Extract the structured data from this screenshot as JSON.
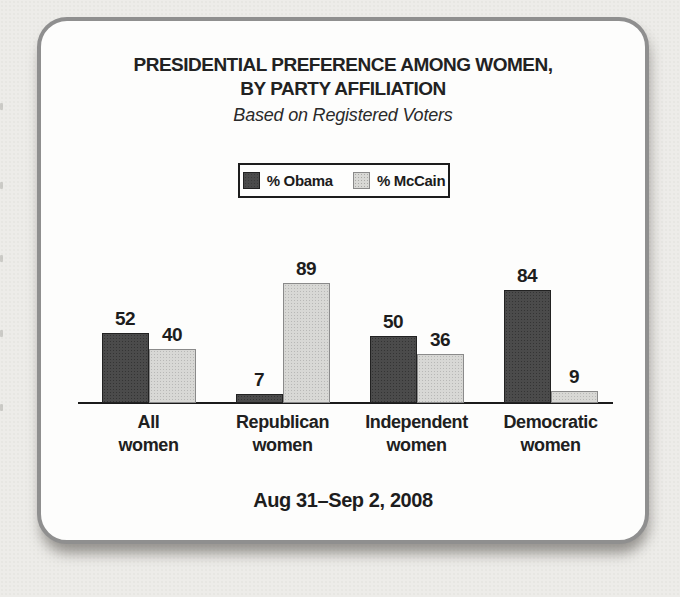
{
  "page": {
    "background_color": "#edece9",
    "card_background": "#fdfdfc",
    "card_border_color": "#8f8f8f",
    "axis_color": "#1b1b1b"
  },
  "chart_data": {
    "type": "bar",
    "title_lines": [
      "PRESIDENTIAL PREFERENCE AMONG WOMEN,",
      "BY PARTY AFFILIATION"
    ],
    "subtitle": "Based on Registered Voters",
    "categories": [
      "All women",
      "Republican women",
      "Independent women",
      "Democratic women"
    ],
    "category_label_lines": [
      [
        "All",
        "women"
      ],
      [
        "Republican",
        "women"
      ],
      [
        "Independent",
        "women"
      ],
      [
        "Democratic",
        "women"
      ]
    ],
    "series": [
      {
        "name": "% Obama",
        "color": "#4b4b4b",
        "border_color": "#222222",
        "values": [
          52,
          7,
          50,
          84
        ]
      },
      {
        "name": "% McCain",
        "color": "#d8d8d5",
        "border_color": "#8a8a8a",
        "values": [
          40,
          89,
          36,
          9
        ]
      }
    ],
    "value_labels_shown": true,
    "footer": "Aug 31–Sep 2, 2008",
    "xlabel": "",
    "ylabel": "",
    "ylim": [
      0,
      100
    ],
    "grid": false,
    "legend_position": "top-center"
  }
}
